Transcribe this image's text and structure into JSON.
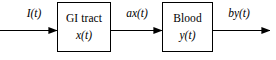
{
  "diagram": {
    "type": "block-flow-diagram",
    "background_color": "#ffffff",
    "stroke_color": "#000000",
    "blocks": [
      {
        "id": "gi-tract",
        "title": "GI tract",
        "subtitle": "x(t)",
        "x": 57,
        "y": 2,
        "width": 54,
        "height": 50
      },
      {
        "id": "blood",
        "title": "Blood",
        "subtitle": "y(t)",
        "x": 162,
        "y": 2,
        "width": 51,
        "height": 50
      }
    ],
    "arrows": [
      {
        "id": "input-arrow",
        "label": "I(t)",
        "from": "source",
        "to": "gi-tract",
        "x1": 0,
        "x2": 57,
        "y": 30
      },
      {
        "id": "middle-arrow",
        "label": "ax(t)",
        "from": "gi-tract",
        "to": "blood",
        "x1": 111,
        "x2": 162,
        "y": 30
      },
      {
        "id": "output-arrow",
        "label": "by(t)",
        "from": "blood",
        "to": "sink",
        "x1": 213,
        "x2": 270,
        "y": 30
      }
    ]
  }
}
